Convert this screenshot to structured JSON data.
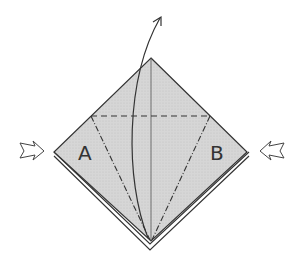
{
  "diagram": {
    "type": "origami-step",
    "labels": {
      "left_flap": "A",
      "right_flap": "B"
    },
    "colors": {
      "paper": "#d4d4d4",
      "line": "#333333",
      "background": "#ffffff"
    },
    "annotations": [
      "push-in arrow left",
      "push-in arrow right",
      "lift arrow up from bottom point",
      "valley fold line horizontal",
      "mountain fold lines diagonal"
    ]
  }
}
